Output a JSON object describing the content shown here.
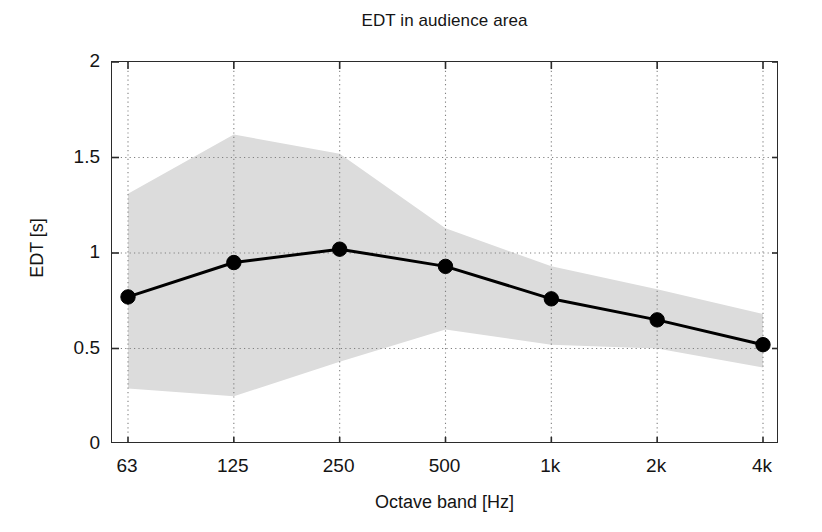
{
  "chart_data": {
    "type": "line",
    "title": "EDT in audience area",
    "xlabel": "Octave band [Hz]",
    "ylabel": "EDT [s]",
    "categories": [
      "63",
      "125",
      "250",
      "500",
      "1k",
      "2k",
      "4k"
    ],
    "series": [
      {
        "name": "EDT mean",
        "values": [
          0.77,
          0.95,
          1.02,
          0.93,
          0.76,
          0.65,
          0.52
        ],
        "marker": "filled-circle",
        "color": "#000000",
        "linewidth": 3
      }
    ],
    "bands": [
      {
        "name": "EDT spread",
        "upper": [
          1.31,
          1.62,
          1.52,
          1.13,
          0.93,
          0.81,
          0.68
        ],
        "lower": [
          0.29,
          0.25,
          0.43,
          0.6,
          0.52,
          0.5,
          0.4
        ],
        "color": "#dcdcdc",
        "opacity": 1
      }
    ],
    "ylim": [
      0,
      2
    ],
    "yticks": [
      0,
      0.5,
      1,
      1.5,
      2
    ],
    "ytick_labels": [
      "0",
      "0.5",
      "1",
      "1.5",
      "2"
    ],
    "xtick_labels": [
      "63",
      "125",
      "250",
      "500",
      "1k",
      "2k",
      "4k"
    ],
    "grid": "dotted-both-axes",
    "grid_color": "#808080",
    "legend": "none",
    "frame_color": "#2b2b2b",
    "background": "#ffffff"
  }
}
